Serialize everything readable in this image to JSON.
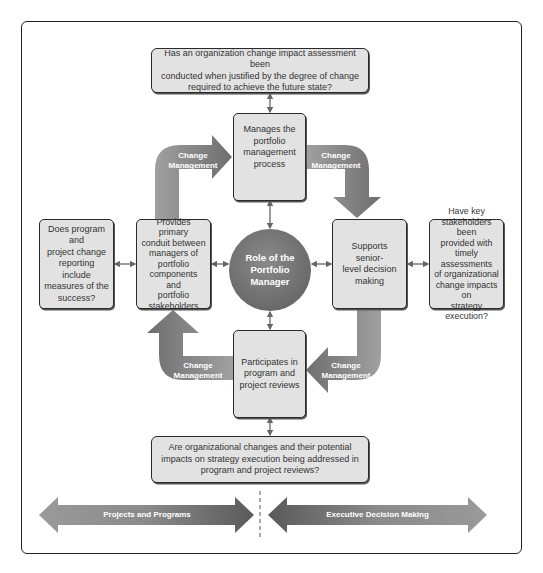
{
  "diagram": {
    "center": {
      "label": "Role of the Portfolio Manager"
    },
    "top_question": {
      "lines": [
        "Has an organization change impact assessment been",
        "conducted when justified by the degree of change",
        "required to achieve the future state?"
      ]
    },
    "bottom_question": {
      "lines": [
        "Are organizational changes and their potential",
        "impacts on strategy execution being addressed in",
        "program and project reviews?"
      ]
    },
    "left_question": {
      "lines": [
        "Does program and",
        "project change",
        "reporting include",
        "measures of the",
        "success?"
      ]
    },
    "right_question": {
      "lines": [
        "Have key",
        "stakeholders been",
        "provided with",
        "timely assessments",
        "of organizational",
        "change impacts on",
        "strategy execution?"
      ]
    },
    "roles": {
      "top": {
        "lines": [
          "Manages the",
          "portfolio",
          "management",
          "process"
        ]
      },
      "left": {
        "lines": [
          "Provides primary",
          "conduit between",
          "managers of",
          "portfolio",
          "components and",
          "portfolio",
          "stakeholders"
        ]
      },
      "right": {
        "lines": [
          "Supports senior-",
          "level decision",
          "making"
        ]
      },
      "bottom": {
        "lines": [
          "Participates in",
          "program and",
          "project reviews"
        ]
      }
    },
    "cycle_arrows": [
      {
        "position": "top-left",
        "line1": "Change",
        "line2": "Management"
      },
      {
        "position": "top-right",
        "line1": "Change",
        "line2": "Management"
      },
      {
        "position": "bottom-right",
        "line1": "Change",
        "line2": "Management"
      },
      {
        "position": "bottom-left",
        "line1": "Change",
        "line2": "Management"
      }
    ],
    "spectrum": {
      "left_label": "Projects and Programs",
      "right_label": "Executive Decision Making"
    },
    "colors": {
      "box_fill": "#e2e2e2",
      "box_border": "#2a2a2a",
      "arrow_fill": "#8c8c8c",
      "circle_fill": "#737373",
      "connector": "#666666"
    }
  }
}
